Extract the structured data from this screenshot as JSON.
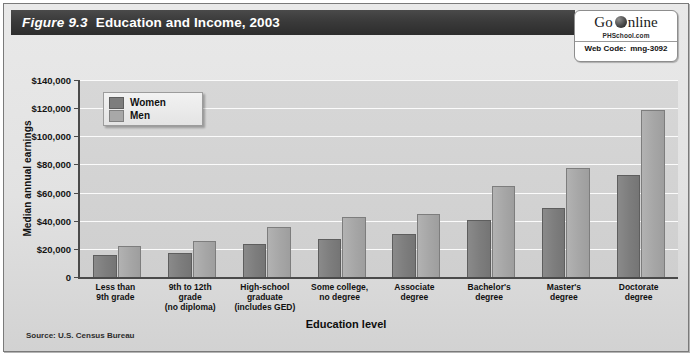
{
  "figure": {
    "number": "Figure 9.3",
    "title": "Education and Income, 2003",
    "source": "Source: U.S. Census Bureau"
  },
  "badge": {
    "go": "Go",
    "online": "nline",
    "globe_icon": "globe-icon",
    "site": "PHSchool.com",
    "web_code_label": "Web Code:",
    "web_code_value": "mng-3092"
  },
  "legend": {
    "items": [
      {
        "label": "Women",
        "color": "#7d7d7d"
      },
      {
        "label": "Men",
        "color": "#a8a8a8"
      }
    ]
  },
  "chart_data": {
    "type": "bar",
    "title": "Education and Income, 2003",
    "xlabel": "Education level",
    "ylabel": "Median annual earnings",
    "ylim": [
      0,
      140000
    ],
    "ytick_step": 20000,
    "ytick_labels": [
      "0",
      "$20,000",
      "$40,000",
      "$60,000",
      "$80,000",
      "$100,000",
      "$120,000",
      "$140,000"
    ],
    "grid": true,
    "legend_position": "upper-left-inside",
    "categories": [
      "Less than\n9th grade",
      "9th to 12th\ngrade\n(no diploma)",
      "High-school\ngraduate\n(includes GED)",
      "Some college,\nno degree",
      "Associate\ndegree",
      "Bachelor's\ndegree",
      "Master's\ndegree",
      "Doctorate\ndegree"
    ],
    "category_lines": [
      [
        "Less than",
        "9th grade"
      ],
      [
        "9th to 12th",
        "grade",
        "(no diploma)"
      ],
      [
        "High-school",
        "graduate",
        "(includes GED)"
      ],
      [
        "Some college,",
        "no degree"
      ],
      [
        "Associate",
        "degree"
      ],
      [
        "Bachelor's",
        "degree"
      ],
      [
        "Master's",
        "degree"
      ],
      [
        "Doctorate",
        "degree"
      ]
    ],
    "series": [
      {
        "name": "Women",
        "color": "#7d7d7d",
        "values": [
          15000,
          16000,
          23000,
          26000,
          30000,
          40000,
          48000,
          72000
        ]
      },
      {
        "name": "Men",
        "color": "#a8a8a8",
        "values": [
          21000,
          25000,
          35000,
          42000,
          44000,
          64000,
          77000,
          118000
        ]
      }
    ]
  }
}
